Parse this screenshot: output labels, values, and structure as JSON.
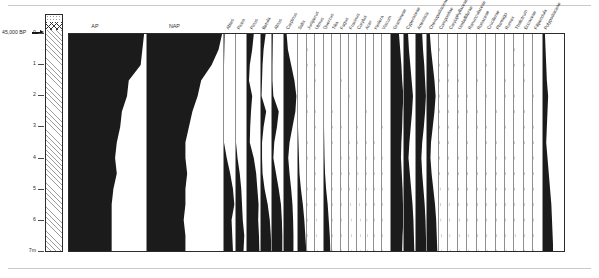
{
  "figure": {
    "type": "pollen-percentage-diagram",
    "depth_axis": {
      "unit_label": "7m",
      "ticks": [
        "0",
        "1",
        "2",
        "3",
        "4",
        "5",
        "6",
        "7"
      ],
      "min": 0,
      "max": 7
    },
    "date_marker": {
      "label": "45,000 BP",
      "depth": 0.0
    },
    "lithology": [
      {
        "name": "stipple-band",
        "pattern": "stipple",
        "from": 0.0,
        "to": 0.22
      },
      {
        "name": "diamond-band",
        "pattern": "diamond-cross-hatch",
        "from": 0.22,
        "to": 0.45
      },
      {
        "name": "hatch-band",
        "pattern": "diagonal-hatch",
        "from": 0.45,
        "to": 7.0
      }
    ],
    "summary_curves": [
      {
        "label": "AP"
      },
      {
        "label": "NAP"
      }
    ],
    "chart_data": {
      "type": "area",
      "title": "",
      "xlabel": "",
      "ylabel": "Depth (m)",
      "ylim": [
        0,
        7
      ],
      "grid": false,
      "legend": "none",
      "orientation": "horizontal-silhouettes-vs-depth",
      "depths": [
        0.0,
        0.5,
        1.0,
        1.5,
        2.0,
        2.5,
        3.0,
        3.5,
        4.0,
        4.5,
        5.0,
        5.5,
        6.0,
        6.5,
        7.0
      ],
      "series": [
        {
          "name": "AP",
          "width": 74,
          "filled": true,
          "values": [
            88,
            86,
            84,
            70,
            68,
            62,
            60,
            56,
            54,
            56,
            52,
            50,
            50,
            50,
            50
          ]
        },
        {
          "name": "NAP",
          "width": 74,
          "filled": true,
          "values": [
            86,
            82,
            74,
            62,
            58,
            52,
            48,
            44,
            44,
            46,
            44,
            44,
            42,
            44,
            44
          ]
        },
        {
          "name": "Abies",
          "width": 11,
          "filled": true,
          "values": [
            2,
            1,
            0,
            0,
            0,
            0,
            0,
            0,
            8,
            18,
            26,
            30,
            22,
            24,
            26
          ]
        },
        {
          "name": "Picea",
          "width": 11,
          "filled": true,
          "values": [
            0,
            0,
            0,
            0,
            0,
            0,
            0,
            0,
            4,
            10,
            14,
            16,
            18,
            22,
            20
          ]
        },
        {
          "name": "Pinus",
          "width": 13,
          "filled": true,
          "values": [
            34,
            26,
            14,
            10,
            26,
            20,
            16,
            14,
            34,
            46,
            52,
            58,
            56,
            60,
            62
          ]
        },
        {
          "name": "Betula",
          "width": 11,
          "filled": true,
          "values": [
            18,
            10,
            6,
            4,
            2,
            20,
            10,
            4,
            4,
            6,
            14,
            26,
            34,
            38,
            40
          ]
        },
        {
          "name": "Alnus",
          "width": 11,
          "filled": true,
          "values": [
            4,
            3,
            2,
            2,
            6,
            30,
            22,
            10,
            6,
            18,
            30,
            40,
            44,
            46,
            46
          ]
        },
        {
          "name": "Carpinus",
          "width": 13,
          "filled": true,
          "values": [
            16,
            24,
            44,
            64,
            76,
            70,
            52,
            34,
            26,
            34,
            44,
            52,
            56,
            58,
            58
          ]
        },
        {
          "name": "Salix",
          "width": 9,
          "filled": true,
          "values": [
            0,
            0,
            0,
            0,
            0,
            0,
            0,
            2,
            4,
            6,
            12,
            20,
            26,
            30,
            34
          ]
        },
        {
          "name": "Juniperus",
          "width": 8,
          "filled": false,
          "dots": true,
          "values": [
            0,
            1,
            1,
            0,
            1,
            1,
            0,
            1,
            1,
            0,
            2,
            2,
            3,
            2,
            2
          ]
        },
        {
          "name": "Ulmus",
          "width": 8,
          "filled": false,
          "dots": true,
          "values": [
            0,
            0,
            1,
            1,
            0,
            1,
            1,
            0,
            1,
            1,
            2,
            4,
            6,
            8,
            10
          ]
        },
        {
          "name": "Quercus",
          "width": 8,
          "filled": true,
          "values": [
            0,
            0,
            0,
            0,
            0,
            0,
            0,
            1,
            2,
            4,
            8,
            14,
            18,
            22,
            24
          ]
        },
        {
          "name": "Tilia",
          "width": 8,
          "filled": false,
          "dots": true,
          "values": [
            0,
            0,
            0,
            0,
            0,
            1,
            1,
            1,
            0,
            1,
            1,
            2,
            2,
            3,
            3
          ]
        },
        {
          "name": "Fagus",
          "width": 8,
          "filled": false,
          "dots": true,
          "values": [
            0,
            0,
            0,
            1,
            0,
            0,
            1,
            0,
            1,
            1,
            1,
            2,
            2,
            2,
            2
          ]
        },
        {
          "name": "Fraxinus",
          "width": 8,
          "filled": false,
          "dots": true,
          "values": [
            0,
            0,
            0,
            0,
            1,
            0,
            0,
            1,
            1,
            2,
            3,
            6,
            10,
            12,
            14
          ]
        },
        {
          "name": "Corylus",
          "width": 8,
          "filled": false,
          "dots": true,
          "values": [
            0,
            0,
            0,
            0,
            0,
            0,
            1,
            1,
            2,
            4,
            8,
            12,
            16,
            18,
            20
          ]
        },
        {
          "name": "Acer",
          "width": 8,
          "filled": false,
          "dots": true,
          "values": [
            0,
            0,
            0,
            0,
            0,
            1,
            0,
            1,
            1,
            1,
            2,
            3,
            4,
            5,
            6
          ]
        },
        {
          "name": "Hedera",
          "width": 8,
          "filled": false,
          "dots": true,
          "values": [
            0,
            0,
            0,
            0,
            0,
            0,
            0,
            1,
            1,
            1,
            2,
            2,
            3,
            3,
            4
          ]
        },
        {
          "name": "Viscum",
          "width": 8,
          "filled": false,
          "dots": true,
          "values": [
            0,
            0,
            0,
            0,
            0,
            0,
            1,
            0,
            1,
            1,
            1,
            2,
            2,
            2,
            3
          ]
        },
        {
          "name": "Gramineae",
          "width": 13,
          "filled": true,
          "values": [
            40,
            46,
            52,
            56,
            62,
            58,
            56,
            52,
            50,
            54,
            58,
            60,
            62,
            58,
            56
          ]
        },
        {
          "name": "Cyperaceae",
          "width": 11,
          "filled": true,
          "values": [
            18,
            22,
            28,
            34,
            40,
            36,
            30,
            24,
            20,
            26,
            32,
            38,
            42,
            44,
            46
          ]
        },
        {
          "name": "Artemisia",
          "width": 11,
          "filled": true,
          "values": [
            30,
            34,
            40,
            44,
            48,
            44,
            38,
            30,
            26,
            30,
            36,
            42,
            46,
            48,
            50
          ]
        },
        {
          "name": "Chenopodiaceae",
          "width": 11,
          "filled": true,
          "values": [
            10,
            14,
            20,
            26,
            30,
            26,
            20,
            14,
            12,
            16,
            22,
            28,
            32,
            34,
            36
          ]
        },
        {
          "name": "Compositae",
          "width": 9,
          "filled": false,
          "dots": true,
          "values": [
            0,
            1,
            2,
            2,
            3,
            2,
            2,
            1,
            1,
            2,
            4,
            6,
            8,
            10,
            12
          ]
        },
        {
          "name": "Caryophyllaceae",
          "width": 9,
          "filled": false,
          "dots": true,
          "values": [
            0,
            0,
            1,
            1,
            2,
            1,
            1,
            1,
            1,
            2,
            3,
            4,
            6,
            8,
            10
          ]
        },
        {
          "name": "Umbelliferae",
          "width": 9,
          "filled": false,
          "dots": true,
          "values": [
            0,
            0,
            0,
            1,
            1,
            1,
            1,
            0,
            1,
            1,
            2,
            3,
            4,
            5,
            6
          ]
        },
        {
          "name": "Ranunculaceae",
          "width": 9,
          "filled": false,
          "dots": true,
          "values": [
            0,
            0,
            0,
            0,
            1,
            1,
            0,
            1,
            1,
            1,
            2,
            2,
            3,
            4,
            5
          ]
        },
        {
          "name": "Rosaceae",
          "width": 9,
          "filled": false,
          "dots": true,
          "values": [
            0,
            0,
            0,
            1,
            0,
            1,
            1,
            0,
            1,
            1,
            1,
            2,
            3,
            3,
            4
          ]
        },
        {
          "name": "Cruciferae",
          "width": 9,
          "filled": false,
          "dots": true,
          "values": [
            0,
            0,
            1,
            0,
            1,
            0,
            1,
            1,
            0,
            1,
            2,
            2,
            3,
            3,
            4
          ]
        },
        {
          "name": "Plantago",
          "width": 9,
          "filled": false,
          "dots": true,
          "values": [
            0,
            0,
            0,
            0,
            0,
            1,
            0,
            1,
            1,
            1,
            1,
            2,
            2,
            3,
            3
          ]
        },
        {
          "name": "Rumex",
          "width": 9,
          "filled": false,
          "dots": true,
          "values": [
            0,
            0,
            0,
            1,
            1,
            0,
            1,
            0,
            1,
            1,
            2,
            2,
            3,
            3,
            4
          ]
        },
        {
          "name": "Thalictrum",
          "width": 9,
          "filled": false,
          "dots": true,
          "values": [
            0,
            1,
            1,
            0,
            1,
            1,
            0,
            1,
            1,
            2,
            2,
            3,
            3,
            4,
            4
          ]
        },
        {
          "name": "Ericaceae",
          "width": 9,
          "filled": false,
          "dots": true,
          "values": [
            0,
            0,
            1,
            1,
            0,
            1,
            1,
            1,
            0,
            1,
            2,
            2,
            3,
            3,
            3
          ]
        },
        {
          "name": "Filipendula",
          "width": 9,
          "filled": false,
          "dots": true,
          "values": [
            0,
            0,
            0,
            0,
            1,
            0,
            1,
            1,
            1,
            1,
            1,
            2,
            2,
            2,
            3
          ]
        },
        {
          "name": "Polypodiaceae",
          "width": 10,
          "filled": true,
          "values": [
            6,
            8,
            10,
            12,
            16,
            14,
            12,
            10,
            14,
            18,
            22,
            26,
            28,
            30,
            32
          ]
        }
      ]
    }
  }
}
